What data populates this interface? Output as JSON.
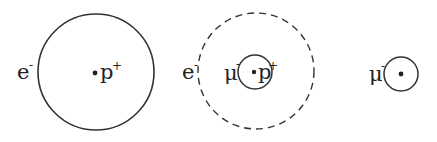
{
  "diagram": {
    "panels": [
      {
        "name": "hydrogen-atom",
        "orbit_label": "e",
        "orbit_charge": "-",
        "nucleus_label": "p",
        "nucleus_charge": "+",
        "orbit_style": "solid"
      },
      {
        "name": "muonic-hydrogen",
        "outer_label": "e",
        "outer_charge": "-",
        "outer_style": "dashed",
        "inner_label": "μ",
        "inner_charge": "-",
        "nucleus_label": "p",
        "nucleus_charge": "+",
        "inner_style": "solid"
      },
      {
        "name": "bare-muon-orbit",
        "orbit_label": "μ",
        "orbit_charge": "-",
        "orbit_style": "solid"
      }
    ],
    "colors": {
      "stroke": "#333333",
      "text": "#222222",
      "background": "#ffffff"
    }
  }
}
